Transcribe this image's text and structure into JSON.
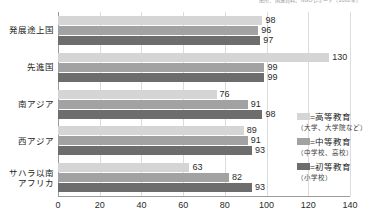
{
  "source_note": "出所：国連資料、NGOレポート（2000年）",
  "legend": {
    "position": "right",
    "entries": [
      {
        "name": "tertiary",
        "label": "=高等教育",
        "sub": "（大学、大学院など）",
        "color": "#d5d5d5"
      },
      {
        "name": "secondary",
        "label": "=中等教育",
        "sub": "（中学校、高校）",
        "color": "#a2a2a2"
      },
      {
        "name": "primary",
        "label": "=初等教育",
        "sub": "（小学校）",
        "color": "#6d6d6d"
      }
    ]
  },
  "chart_data": {
    "type": "bar",
    "orientation": "horizontal",
    "title": "",
    "xlabel": "",
    "ylabel": "",
    "xlim": [
      0,
      140
    ],
    "xticks": [
      0,
      20,
      40,
      60,
      80,
      100,
      120,
      140
    ],
    "xticklabels": [
      "0",
      "20",
      "40",
      "60",
      "80",
      "100",
      "120",
      "140"
    ],
    "grid": true,
    "categories": [
      "発展途上国",
      "先進国",
      "南アジア",
      "西アジア",
      "サハラ以南\nアフリカ"
    ],
    "series": [
      {
        "name": "高等教育（大学、大学院など）",
        "color": "#d5d5d5",
        "values": [
          98,
          130,
          76,
          89,
          63
        ]
      },
      {
        "name": "中等教育（中学校、高校）",
        "color": "#a2a2a2",
        "values": [
          96,
          99,
          91,
          91,
          82
        ]
      },
      {
        "name": "初等教育（小学校）",
        "color": "#6d6d6d",
        "values": [
          97,
          99,
          98,
          93,
          93
        ]
      }
    ]
  }
}
